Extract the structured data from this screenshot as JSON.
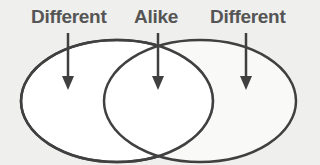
{
  "diagram": {
    "type": "venn",
    "labels": {
      "left": "Different",
      "middle": "Alike",
      "right": "Different"
    },
    "colors": {
      "stroke": "#404040",
      "fill": "#ffffff",
      "text": "#555555",
      "background": "#efefed"
    }
  }
}
